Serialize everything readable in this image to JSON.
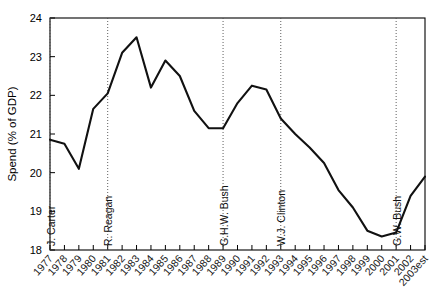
{
  "chart_data": {
    "type": "line",
    "title": "",
    "xlabel": "",
    "ylabel": "Spend  (% of GDP)",
    "ylim": [
      18,
      24
    ],
    "yticks": [
      18,
      19,
      20,
      21,
      22,
      23,
      24
    ],
    "ytick_labels": [
      "18",
      "19",
      "20",
      "21",
      "22",
      "23",
      "24"
    ],
    "grid": false,
    "legend": "none",
    "line_color": "#111111",
    "categories": [
      "1977",
      "1978",
      "1979",
      "1980",
      "1981",
      "1982",
      "1983",
      "1984",
      "1985",
      "1986",
      "1987",
      "1988",
      "1989",
      "1990",
      "1991",
      "1992",
      "1993",
      "1994",
      "1995",
      "1996",
      "1997",
      "1998",
      "1999",
      "2000",
      "2001",
      "2002",
      "2003est"
    ],
    "values": [
      20.85,
      20.75,
      20.1,
      21.65,
      22.05,
      23.1,
      23.5,
      22.2,
      22.9,
      22.5,
      21.6,
      21.15,
      21.15,
      21.8,
      22.25,
      22.15,
      21.4,
      21.0,
      20.65,
      20.25,
      19.55,
      19.1,
      18.5,
      18.35,
      18.45,
      19.4,
      19.9
    ],
    "annotations": [
      {
        "label": "J. Carter",
        "at_category": "1977"
      },
      {
        "label": "R. Reagan",
        "at_category": "1981"
      },
      {
        "label": "G.H.W. Bush",
        "at_category": "1989"
      },
      {
        "label": "W.J. Clinton",
        "at_category": "1993"
      },
      {
        "label": "G.W. Bush",
        "at_category": "2001"
      }
    ]
  }
}
